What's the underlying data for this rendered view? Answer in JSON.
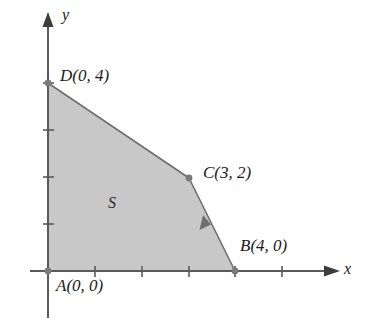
{
  "figure": {
    "background_color": "#ffffff",
    "region_fill_color": "#c8c8c8",
    "region_stroke_color": "#6e6e6e",
    "axis_color": "#5a5a5a",
    "text_color": "#1a1a1a"
  },
  "axes": {
    "x_label": "x",
    "y_label": "y",
    "x_ticks": [
      "1",
      "2",
      "3",
      "4",
      "5"
    ],
    "y_ticks": [
      "1",
      "2",
      "3",
      "4"
    ],
    "grid": false,
    "xlim": [
      0,
      6
    ],
    "ylim": [
      0,
      5
    ]
  },
  "region": {
    "label": "S",
    "vertices": [
      {
        "name": "A",
        "label": "A(0, 0)",
        "x": 0,
        "y": 0
      },
      {
        "name": "B",
        "label": "B(4, 0)",
        "x": 4,
        "y": 0
      },
      {
        "name": "C",
        "label": "C(3, 2)",
        "x": 3,
        "y": 2
      },
      {
        "name": "D",
        "label": "D(0, 4)",
        "x": 0,
        "y": 4
      }
    ],
    "edge_arrow": {
      "on_edge": "C-B",
      "direction": "toward-C"
    }
  }
}
